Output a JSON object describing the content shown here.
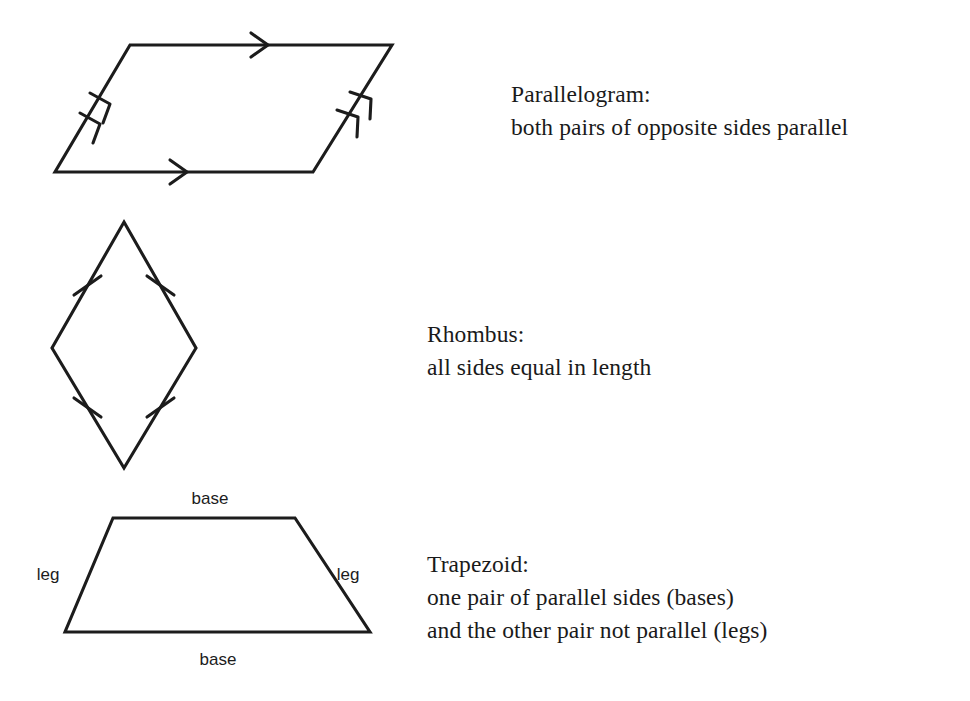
{
  "page": {
    "background_color": "#ffffff",
    "ink_color": "#1c1c1c"
  },
  "figures": [
    {
      "name": "parallelogram",
      "heading": "Parallelogram:",
      "description_lines": [
        "both pairs of opposite sides parallel"
      ],
      "marks": {
        "top_side": "single-arrow",
        "bottom_side": "single-arrow",
        "left_side": "double-arrow",
        "right_side": "double-arrow"
      },
      "vertices": [
        {
          "label": "top-left",
          "x": 130,
          "y": 45
        },
        {
          "label": "top-right",
          "x": 392,
          "y": 45
        },
        {
          "label": "bottom-right",
          "x": 313,
          "y": 172
        },
        {
          "label": "bottom-left",
          "x": 55,
          "y": 172
        }
      ]
    },
    {
      "name": "rhombus",
      "heading": "Rhombus:",
      "description_lines": [
        "all sides equal in length"
      ],
      "marks": {
        "upper_left_side": "single-tick",
        "upper_right_side": "single-tick",
        "lower_left_side": "single-tick",
        "lower_right_side": "single-tick"
      },
      "vertices": [
        {
          "label": "top",
          "x": 124,
          "y": 222
        },
        {
          "label": "right",
          "x": 196,
          "y": 348
        },
        {
          "label": "bottom",
          "x": 124,
          "y": 468
        },
        {
          "label": "left",
          "x": 52,
          "y": 348
        }
      ]
    },
    {
      "name": "trapezoid",
      "heading": "Trapezoid:",
      "description_lines": [
        "one pair of parallel sides (bases)",
        "and the other pair not parallel (legs)"
      ],
      "side_labels": {
        "top_base": "base",
        "bottom_base": "base",
        "left_leg": "leg",
        "right_leg": "leg"
      },
      "vertices": [
        {
          "label": "top-left",
          "x": 113,
          "y": 518
        },
        {
          "label": "top-right",
          "x": 295,
          "y": 518
        },
        {
          "label": "bottom-right",
          "x": 370,
          "y": 632
        },
        {
          "label": "bottom-left",
          "x": 65,
          "y": 632
        }
      ]
    }
  ]
}
